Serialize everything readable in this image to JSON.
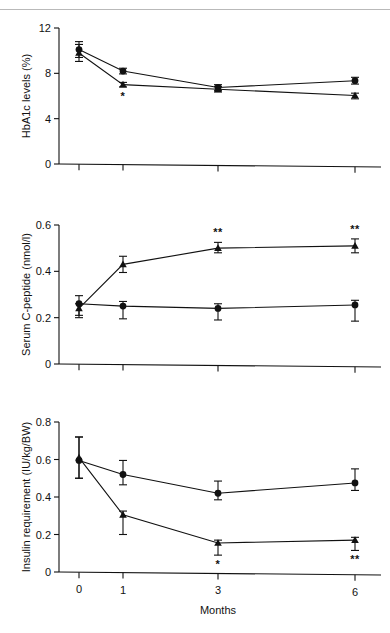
{
  "figure": {
    "xlabel": "Months",
    "categories": [
      "0",
      "1",
      "3",
      "6"
    ]
  },
  "chart_data": [
    {
      "type": "line",
      "panel_id": "hba1c",
      "title": "",
      "ylabel": "HbA1c levels (%)",
      "xlabel": "",
      "categories": [
        "0",
        "1",
        "3",
        "6"
      ],
      "x": [
        0,
        1,
        3,
        6
      ],
      "ylim": [
        0,
        12
      ],
      "yticks": [
        0,
        4,
        8,
        12
      ],
      "ytick_labels": [
        "0",
        "4",
        "8",
        "12"
      ],
      "grid": false,
      "legend": "none",
      "series": [
        {
          "name": "circle-series",
          "marker": "circle",
          "values": [
            10.1,
            8.2,
            6.75,
            7.35
          ],
          "err_low": [
            0.7,
            0.25,
            0.25,
            0.3
          ],
          "err_high": [
            0.7,
            0.25,
            0.25,
            0.3
          ]
        },
        {
          "name": "triangle-series",
          "marker": "triangle",
          "values": [
            9.8,
            7.0,
            6.6,
            6.05
          ],
          "err_low": [
            0.75,
            0.2,
            0.25,
            0.3
          ],
          "err_high": [
            0.75,
            0.2,
            0.25,
            0.2
          ]
        }
      ],
      "annotations": [
        {
          "text": "*",
          "x_index": 1,
          "series": "triangle-series",
          "position": "below"
        }
      ]
    },
    {
      "type": "line",
      "panel_id": "c-peptide",
      "title": "",
      "ylabel": "Serum C-peptide (nmol/l)",
      "xlabel": "",
      "categories": [
        "0",
        "1",
        "3",
        "6"
      ],
      "x": [
        0,
        1,
        3,
        6
      ],
      "ylim": [
        0,
        0.6
      ],
      "yticks": [
        0,
        0.2,
        0.4,
        0.6
      ],
      "ytick_labels": [
        "0",
        "0.2",
        "0.4",
        "0.6"
      ],
      "grid": false,
      "legend": "none",
      "series": [
        {
          "name": "circle-series",
          "marker": "circle",
          "values": [
            0.26,
            0.25,
            0.24,
            0.255
          ],
          "err_low": [
            0.05,
            0.055,
            0.05,
            0.07
          ],
          "err_high": [
            0.035,
            0.02,
            0.02,
            0.02
          ]
        },
        {
          "name": "triangle-series",
          "marker": "triangle",
          "values": [
            0.24,
            0.43,
            0.5,
            0.51
          ],
          "err_low": [
            0.04,
            0.035,
            0.02,
            0.03
          ],
          "err_high": [
            0.02,
            0.035,
            0.025,
            0.03
          ]
        }
      ],
      "annotations": [
        {
          "text": "**",
          "x_index": 2,
          "series": "triangle-series",
          "position": "above"
        },
        {
          "text": "**",
          "x_index": 3,
          "series": "triangle-series",
          "position": "above"
        }
      ]
    },
    {
      "type": "line",
      "panel_id": "insulin",
      "title": "",
      "ylabel": "Insulin requirement (IU/kg/BW)",
      "xlabel": "Months",
      "categories": [
        "0",
        "1",
        "3",
        "6"
      ],
      "x": [
        0,
        1,
        3,
        6
      ],
      "ylim": [
        0,
        0.8
      ],
      "yticks": [
        0,
        0.2,
        0.4,
        0.6,
        0.8
      ],
      "ytick_labels": [
        "0",
        "0.2",
        "0.4",
        "0.6",
        "0.8"
      ],
      "grid": false,
      "legend": "none",
      "series": [
        {
          "name": "circle-series",
          "marker": "circle",
          "values": [
            0.595,
            0.52,
            0.42,
            0.475
          ],
          "err_low": [
            0.095,
            0.055,
            0.035,
            0.04
          ],
          "err_high": [
            0.125,
            0.075,
            0.065,
            0.075
          ]
        },
        {
          "name": "triangle-series",
          "marker": "triangle",
          "values": [
            0.61,
            0.305,
            0.155,
            0.17
          ],
          "err_low": [
            0.11,
            0.105,
            0.065,
            0.055
          ],
          "err_high": [
            0.11,
            0.02,
            0.015,
            0.015
          ]
        }
      ],
      "annotations": [
        {
          "text": "*",
          "x_index": 2,
          "series": "triangle-series",
          "position": "below"
        },
        {
          "text": "**",
          "x_index": 3,
          "series": "triangle-series",
          "position": "below"
        }
      ]
    }
  ]
}
